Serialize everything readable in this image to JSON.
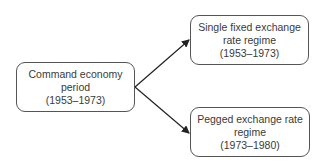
{
  "diagram": {
    "type": "flow",
    "nodes": [
      {
        "id": "command-economy",
        "lines": [
          "Command economy",
          "period",
          "(1953–1973)"
        ]
      },
      {
        "id": "single-fixed",
        "lines": [
          "Single fixed exchange",
          "rate regime",
          "(1953–1973)"
        ]
      },
      {
        "id": "pegged",
        "lines": [
          "Pegged exchange rate",
          "regime",
          "(1973–1980)"
        ]
      }
    ],
    "edges": [
      {
        "from": "command-economy",
        "to": "single-fixed"
      },
      {
        "from": "command-economy",
        "to": "pegged"
      }
    ],
    "colors": {
      "border": "#555555",
      "arrow": "#222222",
      "text": "#3a3a3a",
      "background": "#ffffff"
    }
  }
}
